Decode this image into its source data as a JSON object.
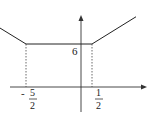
{
  "chart_data": {
    "type": "line",
    "title": "",
    "xlabel": "",
    "ylabel": "",
    "series": [
      {
        "name": "f(x)",
        "x": [
          -4.2,
          -2.5,
          0.5,
          2.5
        ],
        "y": [
          9.2,
          6,
          6,
          9.8
        ]
      }
    ],
    "xlim": [
      -5.0,
      3.2
    ],
    "ylim": [
      -1.5,
      10.0
    ],
    "annotations": {
      "y_level_label": "6",
      "x_tick_left": {
        "value": -2.5,
        "sign": "-",
        "numerator": "5",
        "denominator": "2"
      },
      "x_tick_right": {
        "value": 0.5,
        "numerator": "1",
        "denominator": "2"
      }
    },
    "grid": false,
    "colors": {
      "line": "#222222",
      "axis": "#333333",
      "dash": "#444444"
    }
  }
}
